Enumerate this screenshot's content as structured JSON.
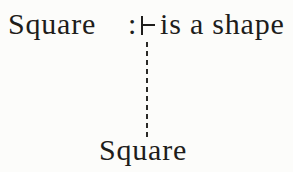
{
  "figure": {
    "kind": "sort-declaration-diagram",
    "declaration": {
      "subject": "Square",
      "colon": ":",
      "turnstile_symbol": "⊢",
      "predicate": "is a shape"
    },
    "child": {
      "label": "Square"
    },
    "connector": {
      "style": "dashed",
      "orientation": "vertical"
    }
  },
  "colors": {
    "background": "#fcfcfa",
    "text": "#1e1d1b",
    "line": "#2a2926"
  }
}
